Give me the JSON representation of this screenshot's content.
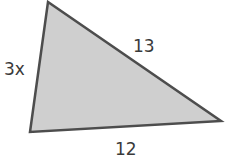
{
  "figure": {
    "type": "triangle",
    "fill_color": "#cfcfcf",
    "stroke_color": "#4d4d4d",
    "vertices": {
      "top": [
        48,
        2
      ],
      "bottom_left": [
        30,
        132
      ],
      "right": [
        221,
        121
      ]
    },
    "sides": {
      "left": "3x",
      "hypotenuse": "13",
      "bottom": "12"
    }
  }
}
